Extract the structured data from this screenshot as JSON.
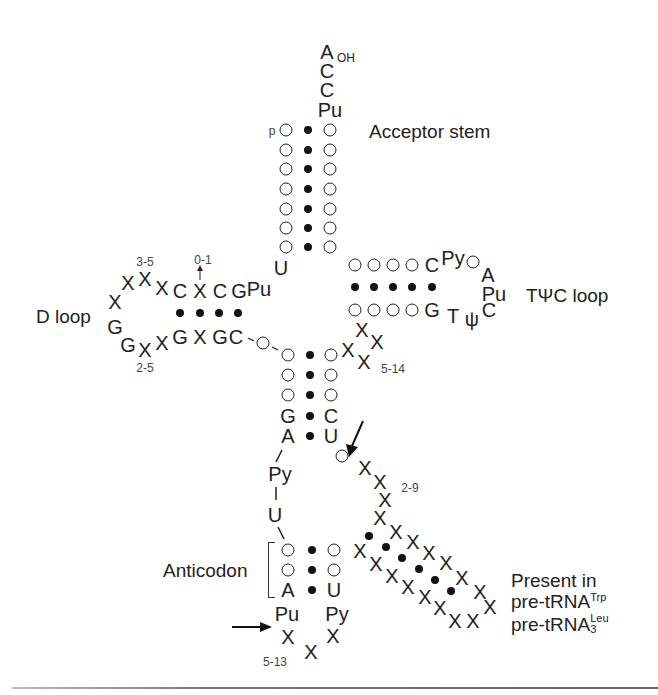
{
  "figure": {
    "type": "tRNA cloverleaf secondary structure",
    "labels": {
      "acceptor_stem": "Acceptor stem",
      "d_loop": "D loop",
      "tpsic_loop": "TΨC loop",
      "anticodon": "Anticodon",
      "present_in_line1": "Present in",
      "present_in_line2_base": "pre-tRNA",
      "present_in_line2_sup": "Trp",
      "present_in_line3_base": "pre-tRNA",
      "present_in_line3_sup": "Leu",
      "present_in_line3_sub": "3"
    },
    "acceptor_end": {
      "a": "A",
      "oh": "OH",
      "c1": "C",
      "c2": "C",
      "pu": "Pu",
      "p": "p",
      "u": "U"
    },
    "d_arm": {
      "top": [
        "X",
        "X",
        "X",
        "X",
        "C",
        "X",
        "C",
        "G",
        "Pu"
      ],
      "bottom": [
        "G",
        "G",
        "X",
        "X",
        "G",
        "X",
        "G",
        "C-",
        "O"
      ],
      "range_top": "3-5",
      "range_bottom": "2-5",
      "insert_range": "0-1"
    },
    "tpsic_arm": {
      "top": [
        "O",
        "O",
        "O",
        "O",
        "C",
        "Py",
        "O",
        "A"
      ],
      "bottom": [
        "O",
        "O",
        "O",
        "O",
        "G",
        "T",
        "ψ",
        "C",
        "Pu"
      ],
      "variable_range": "5-14"
    },
    "anticodon_stem": {
      "left": [
        "O",
        "O",
        "O",
        "G",
        "A"
      ],
      "right": [
        "O",
        "O",
        "O",
        "C",
        "U"
      ]
    },
    "anticodon_loop": {
      "py": "Py",
      "u": "U",
      "left": [
        "O",
        "O",
        "A"
      ],
      "right": [
        "O",
        "O",
        "U"
      ],
      "pu": "Pu",
      "py2": "Py",
      "range": "5-13"
    },
    "extra_arm": {
      "range": "2-9"
    },
    "x": "X"
  }
}
